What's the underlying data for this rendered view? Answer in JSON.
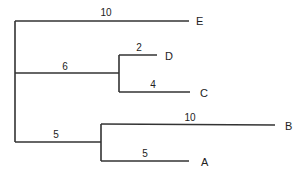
{
  "diagram": {
    "type": "phylogenetic-tree",
    "leaves": [
      "E",
      "D",
      "C",
      "B",
      "A"
    ],
    "branches": [
      {
        "id": "root-E",
        "to": "E",
        "length_label": "10"
      },
      {
        "id": "root-DC",
        "to": "DC",
        "length_label": "6"
      },
      {
        "id": "DC-D",
        "to": "D",
        "length_label": "2"
      },
      {
        "id": "DC-C",
        "to": "C",
        "length_label": "4"
      },
      {
        "id": "root-AB",
        "to": "AB",
        "length_label": "5"
      },
      {
        "id": "AB-B",
        "to": "B",
        "length_label": "10"
      },
      {
        "id": "AB-A",
        "to": "A",
        "length_label": "5"
      }
    ],
    "labels": {
      "E": "E",
      "D": "D",
      "C": "C",
      "B": "B",
      "A": "A",
      "len_E": "10",
      "len_DC": "6",
      "len_D": "2",
      "len_C": "4",
      "len_AB": "5",
      "len_B": "10",
      "len_A": "5"
    }
  }
}
